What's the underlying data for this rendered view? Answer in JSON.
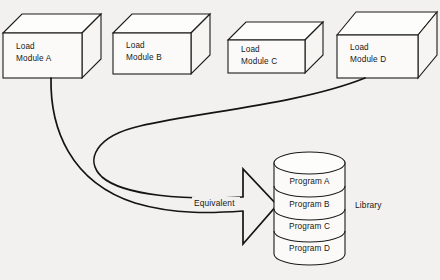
{
  "diagram": {
    "background_color": "#f2f1ef",
    "line_color": "#141414",
    "modules": [
      {
        "id": "module-a",
        "line1": "Load",
        "line2": "Module A"
      },
      {
        "id": "module-b",
        "line1": "Load",
        "line2": "Module B"
      },
      {
        "id": "module-c",
        "line1": "Load",
        "line2": "Module C"
      },
      {
        "id": "module-d",
        "line1": "Load",
        "line2": "Module D"
      }
    ],
    "library": {
      "label": "Library",
      "programs": [
        {
          "id": "program-a",
          "label": "Program A"
        },
        {
          "id": "program-b",
          "label": "Program B"
        },
        {
          "id": "program-c",
          "label": "Program C"
        },
        {
          "id": "program-d",
          "label": "Program D"
        }
      ]
    },
    "relation": {
      "label": "Equivalent",
      "arrow": "block-arrow-right"
    }
  }
}
